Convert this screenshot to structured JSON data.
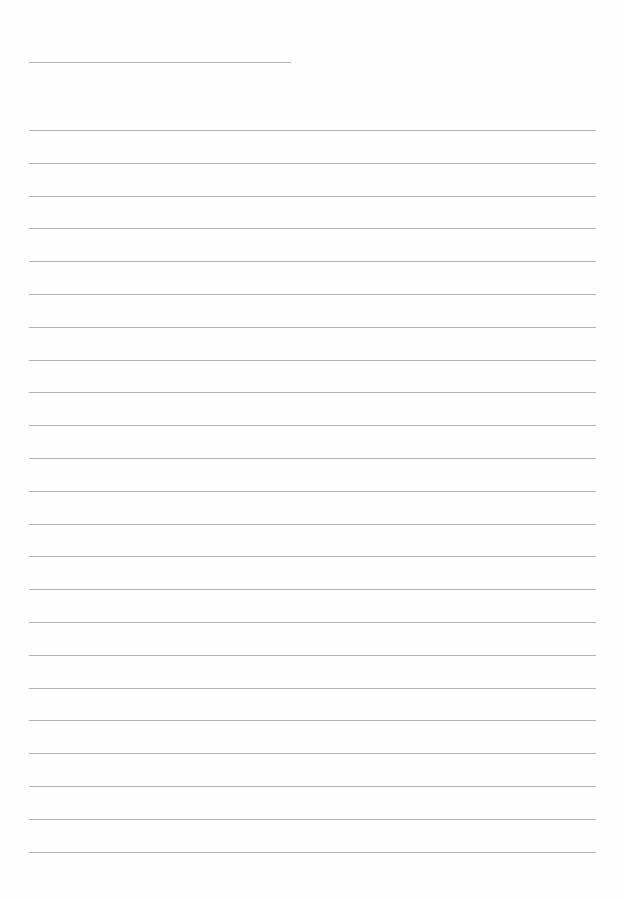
{
  "page": {
    "type": "lined-paper",
    "background": "#fefefe",
    "line_color": "#9a9a9a",
    "header_line": {
      "x1": 29,
      "x2": 291,
      "y": 62
    },
    "ruled_lines": {
      "count": 23,
      "x1": 29,
      "x2": 596,
      "start_y": 130,
      "spacing": 32.8
    }
  }
}
